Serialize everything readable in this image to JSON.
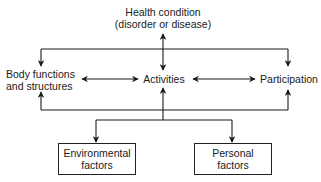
{
  "diagram": {
    "title_node": {
      "line1": "Health condition",
      "line2": "(disorder or disease)"
    },
    "middle_nodes": [
      {
        "line1": "Body functions",
        "line2": "and structures"
      },
      {
        "line1": "Activities"
      },
      {
        "line1": "Participation"
      }
    ],
    "bottom_nodes": [
      {
        "line1": "Environmental",
        "line2": "factors"
      },
      {
        "line1": "Personal",
        "line2": "factors"
      }
    ],
    "edges": [
      {
        "from": "Health condition",
        "to": "Activities",
        "type": "bidirectional"
      },
      {
        "from": "Health condition",
        "to": "Body functions and structures",
        "type": "directed"
      },
      {
        "from": "Health condition",
        "to": "Participation",
        "type": "directed"
      },
      {
        "from": "Body functions and structures",
        "to": "Activities",
        "type": "bidirectional"
      },
      {
        "from": "Activities",
        "to": "Participation",
        "type": "bidirectional"
      },
      {
        "from": "Contextual factors",
        "to": "Body functions and structures",
        "type": "directed"
      },
      {
        "from": "Contextual factors",
        "to": "Activities",
        "type": "directed"
      },
      {
        "from": "Contextual factors",
        "to": "Participation",
        "type": "directed"
      },
      {
        "from": "Activities",
        "to": "Environmental factors",
        "type": "directed"
      },
      {
        "from": "Activities",
        "to": "Personal factors",
        "type": "directed"
      }
    ],
    "colors": {
      "line": "#1a1a1a",
      "background": "#ffffff"
    }
  }
}
